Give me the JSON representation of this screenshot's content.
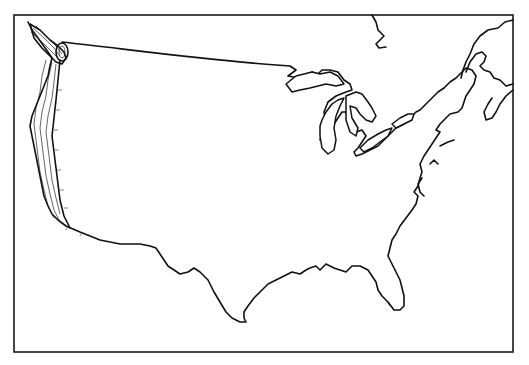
{
  "map": {
    "subject": "Outline map of the contiguous United States",
    "highlight_region": "Pacific coast (Washington, Oregon, California) drawn with parallel contour bands",
    "colors": {
      "background": "#ffffff",
      "outline": "#111111"
    },
    "labels": []
  }
}
